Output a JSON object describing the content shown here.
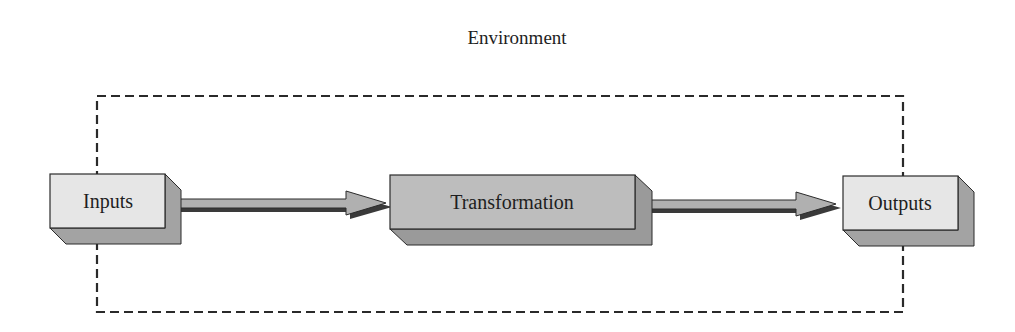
{
  "diagram": {
    "title": "Environment",
    "boundary": {
      "style": "dashed",
      "label_ref": "Environment"
    },
    "nodes": [
      {
        "id": "inputs",
        "label": "Inputs",
        "fill": "#e6e6e6",
        "side": "#a3a3a3"
      },
      {
        "id": "transformation",
        "label": "Transformation",
        "fill": "#bdbdbd",
        "side": "#9a9a9a"
      },
      {
        "id": "outputs",
        "label": "Outputs",
        "fill": "#e6e6e6",
        "side": "#a3a3a3"
      }
    ],
    "edges": [
      {
        "from": "inputs",
        "to": "transformation"
      },
      {
        "from": "transformation",
        "to": "outputs"
      }
    ],
    "colors": {
      "stroke": "#2b2b2b",
      "arrow_fill": "#b0b0b0",
      "arrow_shadow": "#3a3a3a",
      "dash": "#2a2a2a"
    }
  }
}
